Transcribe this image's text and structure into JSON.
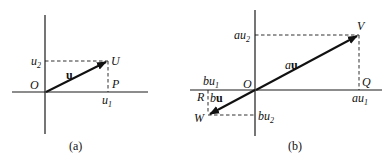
{
  "figure_a": {
    "caption": "(a)",
    "origin_label": "O",
    "point_label": "U",
    "foot_label": "P",
    "vector_label": "u",
    "x_component": {
      "base": "u",
      "sub": "1"
    },
    "y_component": {
      "base": "u",
      "sub": "2"
    }
  },
  "figure_b": {
    "caption": "(b)",
    "origin_label": "O",
    "point_v_label": "V",
    "point_w_label": "W",
    "foot_q_label": "Q",
    "foot_r_label": "R",
    "vector_au": {
      "scalar": "a",
      "vec": "u"
    },
    "vector_bu": {
      "scalar": "b",
      "vec": "u"
    },
    "au1": {
      "base": "au",
      "sub": "1"
    },
    "au2": {
      "base": "au",
      "sub": "2"
    },
    "bu1": {
      "base": "bu",
      "sub": "1"
    },
    "bu2": {
      "base": "bu",
      "sub": "2"
    }
  }
}
